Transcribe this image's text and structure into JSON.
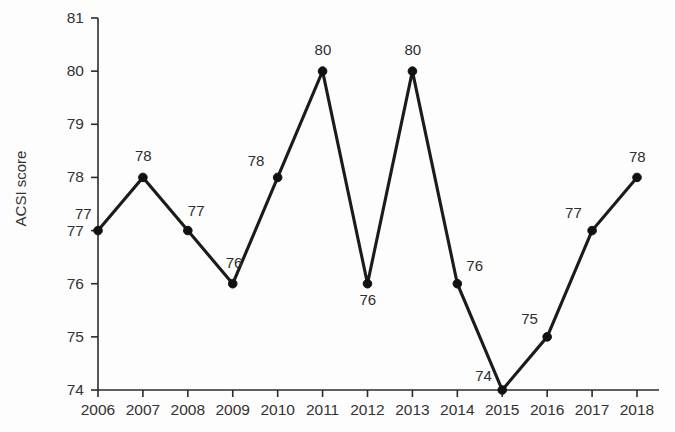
{
  "chart_data": {
    "type": "line",
    "title": "",
    "xlabel": "",
    "ylabel": "ACSI score",
    "categories": [
      "2006",
      "2007",
      "2008",
      "2009",
      "2010",
      "2011",
      "2012",
      "2013",
      "2014",
      "2015",
      "2016",
      "2017",
      "2018"
    ],
    "values": [
      77,
      78,
      77,
      76,
      78,
      80,
      76,
      80,
      76,
      74,
      75,
      77,
      78
    ],
    "point_labels": [
      "77",
      "78",
      "77",
      "76",
      "78",
      "80",
      "76",
      "80",
      "76",
      "74",
      "75",
      "77",
      "78"
    ],
    "ylim": [
      74,
      81
    ],
    "yticks": [
      74,
      75,
      76,
      77,
      78,
      79,
      80,
      81
    ],
    "ytick_labels": [
      "74",
      "75",
      "76",
      "77",
      "78",
      "79",
      "80",
      "81"
    ],
    "grid": false,
    "legend": "none",
    "series_color": "#1b1b1b",
    "marker": "filled-circle"
  },
  "layout": {
    "plot_left": 98,
    "plot_right": 637,
    "plot_top": 18,
    "plot_bottom": 390,
    "label_offsets": [
      {
        "dx": -23,
        "dy": -25
      },
      {
        "dx": -8,
        "dy": -29
      },
      {
        "dx": 0,
        "dy": -28
      },
      {
        "dx": -7,
        "dy": -29
      },
      {
        "dx": -30,
        "dy": -24
      },
      {
        "dx": -8,
        "dy": -29
      },
      {
        "dx": -8,
        "dy": 8
      },
      {
        "dx": -8,
        "dy": -29
      },
      {
        "dx": 9,
        "dy": -26
      },
      {
        "dx": -27,
        "dy": -22
      },
      {
        "dx": -26,
        "dy": -26
      },
      {
        "dx": -27,
        "dy": -26
      },
      {
        "dx": -8,
        "dy": -28
      }
    ]
  }
}
